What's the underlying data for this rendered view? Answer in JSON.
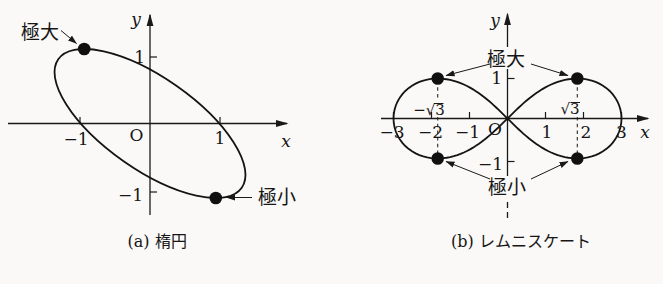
{
  "figure_a": {
    "caption": "(a) 楕円",
    "label_maximum": "極大",
    "label_minimum": "極小",
    "axis_x": "x",
    "axis_y": "y",
    "origin": "O",
    "x_ticks": [
      "−1",
      "1"
    ],
    "y_ticks": [
      "1",
      "−1"
    ]
  },
  "figure_b": {
    "caption": "(b) レムニスケート",
    "label_maximum": "極大",
    "label_minimum": "極小",
    "axis_x": "x",
    "axis_y": "y",
    "origin": "O",
    "x_ticks": [
      "−3",
      "−2",
      "−1",
      "1",
      "2",
      "3"
    ],
    "y_ticks": [
      "1",
      "−1"
    ],
    "sqrt_neg": "−√3",
    "sqrt_pos": "√3"
  },
  "chart_data": [
    {
      "type": "line",
      "title": "(a) 楕円",
      "curve": "tilted ellipse (major axis upper-left to lower-right) crossing x-axis at ±1",
      "xlabel": "x",
      "ylabel": "y",
      "x_ticks": [
        -1,
        1
      ],
      "y_ticks": [
        1,
        -1
      ],
      "annotated_points": [
        {
          "label": "極大",
          "x": -0.95,
          "y": 1.1
        },
        {
          "label": "極小",
          "x": 0.95,
          "y": -1.1
        }
      ],
      "grid": false
    },
    {
      "type": "line",
      "title": "(b) レムニスケート",
      "curve": "lemniscate (figure-eight) through origin O, horizontal extent ±3, guide dashed lines at x=±√3",
      "xlabel": "x",
      "ylabel": "y",
      "x_ticks": [
        -3,
        -2,
        -1,
        1,
        2,
        3
      ],
      "y_ticks": [
        1,
        -1
      ],
      "annotated_points": [
        {
          "label": "極大",
          "x": -1.732,
          "y": 1
        },
        {
          "label": "極大",
          "x": 1.732,
          "y": 1
        },
        {
          "label": "極小",
          "x": -1.732,
          "y": -1
        },
        {
          "label": "極小",
          "x": 1.732,
          "y": -1
        }
      ],
      "guide_lines_x": [
        "−√3",
        "√3"
      ],
      "grid": false
    }
  ]
}
